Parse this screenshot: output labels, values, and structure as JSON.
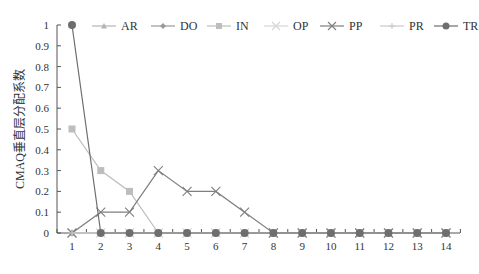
{
  "chart_data": {
    "type": "line",
    "title": "",
    "xlabel": "",
    "ylabel": "CMAQ垂直层分配系数",
    "ylim": [
      0,
      1
    ],
    "yticks": [
      "0",
      "0.1",
      "0.2",
      "0.3",
      "0.4",
      "0.5",
      "0.6",
      "0.7",
      "0.8",
      "0.9",
      "1"
    ],
    "categories": [
      "1",
      "2",
      "3",
      "4",
      "5",
      "6",
      "7",
      "8",
      "9",
      "10",
      "11",
      "12",
      "13",
      "14"
    ],
    "grid": false,
    "legend_position": "top",
    "series": [
      {
        "name": "AR",
        "color": "#b5b5b5",
        "marker": "triangle",
        "values": [
          0,
          0,
          0,
          0,
          0,
          0,
          0,
          0,
          0,
          0,
          0,
          0,
          0,
          0
        ]
      },
      {
        "name": "DO",
        "color": "#9a9a9a",
        "marker": "diamond",
        "values": [
          0,
          0,
          0,
          0,
          0,
          0,
          0,
          0,
          0,
          0,
          0,
          0,
          0,
          0
        ]
      },
      {
        "name": "IN",
        "color": "#bdbdbd",
        "marker": "square",
        "values": [
          0.5,
          0.3,
          0.2,
          0,
          0,
          0,
          0,
          0,
          0,
          0,
          0,
          0,
          0,
          0
        ]
      },
      {
        "name": "OP",
        "color": "#d6d6d6",
        "marker": "x",
        "values": [
          0,
          0,
          0,
          0,
          0,
          0,
          0,
          0,
          0,
          0,
          0,
          0,
          0,
          0
        ]
      },
      {
        "name": "PP",
        "color": "#7f7f7f",
        "marker": "x",
        "values": [
          0,
          0.1,
          0.1,
          0.3,
          0.2,
          0.2,
          0.1,
          0,
          0,
          0,
          0,
          0,
          0,
          0
        ]
      },
      {
        "name": "PR",
        "color": "#c8c8c8",
        "marker": "plus",
        "values": [
          0,
          0,
          0,
          0,
          0,
          0,
          0,
          0,
          0,
          0,
          0,
          0,
          0,
          0
        ]
      },
      {
        "name": "TR",
        "color": "#6e6e6e",
        "marker": "circle",
        "values": [
          1,
          0,
          0,
          0,
          0,
          0,
          0,
          0,
          0,
          0,
          0,
          0,
          0,
          0
        ]
      }
    ]
  }
}
